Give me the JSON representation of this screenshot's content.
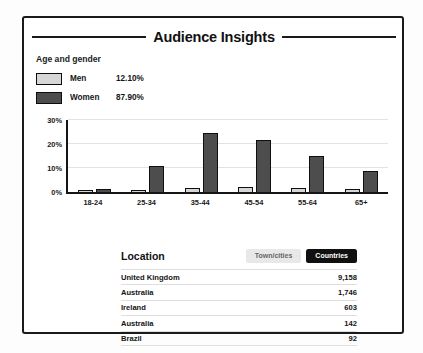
{
  "card": {
    "title": "Audience Insights"
  },
  "age_gender": {
    "heading": "Age and gender",
    "legend": [
      {
        "label": "Men",
        "value": "12.10%",
        "color": "#d6d6d6"
      },
      {
        "label": "Women",
        "value": "87.90%",
        "color": "#4d4d4d"
      }
    ]
  },
  "location": {
    "title": "Location",
    "toggles": [
      {
        "label": "Town/cities",
        "active": false
      },
      {
        "label": "Countries",
        "active": true
      }
    ],
    "rows": [
      {
        "name": "United Kingdom",
        "count": "9,158"
      },
      {
        "name": "Australia",
        "count": "1,746"
      },
      {
        "name": "Ireland",
        "count": "603"
      },
      {
        "name": "Australia",
        "count": "142"
      },
      {
        "name": "Brazil",
        "count": "92"
      }
    ]
  },
  "chart_data": {
    "type": "bar",
    "title": "Age and gender",
    "xlabel": "",
    "ylabel": "",
    "ylim": [
      0,
      30
    ],
    "yticks": [
      0,
      10,
      20,
      30
    ],
    "ytick_labels": [
      "0%",
      "10%",
      "20%",
      "30%"
    ],
    "grid": true,
    "legend_position": "top-left",
    "categories": [
      "18-24",
      "25-34",
      "35-44",
      "45-54",
      "55-64",
      "65+"
    ],
    "series": [
      {
        "name": "Men",
        "color": "#d6d6d6",
        "values": [
          0.7,
          1.0,
          1.5,
          2.2,
          1.8,
          1.2
        ]
      },
      {
        "name": "Women",
        "color": "#4d4d4d",
        "values": [
          1.3,
          11.0,
          24.5,
          21.5,
          15.0,
          8.7
        ]
      }
    ]
  }
}
